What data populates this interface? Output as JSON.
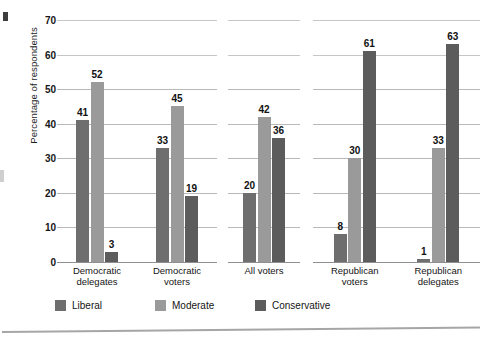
{
  "chart_data": {
    "type": "bar",
    "title": "",
    "xlabel": "",
    "ylabel": "Percentage of respondents",
    "ylim": [
      0,
      70
    ],
    "yticks": [
      0,
      10,
      20,
      30,
      40,
      50,
      60,
      70
    ],
    "grid": true,
    "legend_position": "bottom",
    "categories": [
      "Democratic\ndelegates",
      "Democratic\nvoters",
      "All voters",
      "Republican\nvoters",
      "Republican\ndelegates"
    ],
    "series": [
      {
        "name": "Liberal",
        "color": "#6e6e6e",
        "values": [
          41,
          33,
          20,
          8,
          1
        ]
      },
      {
        "name": "Moderate",
        "color": "#9a9a9a",
        "values": [
          52,
          45,
          42,
          30,
          33
        ]
      },
      {
        "name": "Conservative",
        "color": "#5c5c5c",
        "values": [
          3,
          19,
          36,
          61,
          63
        ]
      }
    ],
    "panels": [
      {
        "categories": [
          "Democratic\ndelegates",
          "Democratic\nvoters"
        ]
      },
      {
        "categories": [
          "All voters"
        ]
      },
      {
        "categories": [
          "Republican\nvoters",
          "Republican\ndelegates"
        ]
      }
    ]
  },
  "legend": {
    "items": [
      {
        "label": "Liberal"
      },
      {
        "label": "Moderate"
      },
      {
        "label": "Conservative"
      }
    ]
  }
}
